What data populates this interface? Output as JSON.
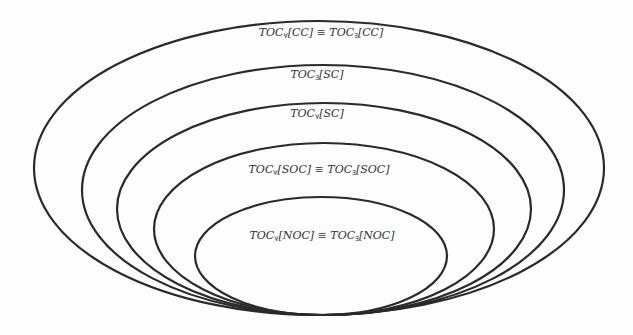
{
  "diagram": {
    "type": "nested-ellipses",
    "stroke_color": "#2a2a2a",
    "sets": [
      {
        "id": "CC",
        "label_parts": {
          "a": "TOC",
          "s1": "∀",
          "b": "[CC] ≡ TOC",
          "s2": "∃",
          "c": "[CC]"
        },
        "ellipse": {
          "cx": 319,
          "cy": 168,
          "rx": 285,
          "ry": 147
        },
        "label_pos": {
          "x": 321,
          "y": 34
        }
      },
      {
        "id": "SC_exists",
        "label_parts": {
          "a": "TOC",
          "s1": "∃",
          "b": "[SC]",
          "s2": "",
          "c": ""
        },
        "ellipse": {
          "cx": 323,
          "cy": 190,
          "rx": 241,
          "ry": 125
        },
        "label_pos": {
          "x": 317,
          "y": 76
        }
      },
      {
        "id": "SC_forall",
        "label_parts": {
          "a": "TOC",
          "s1": "∀",
          "b": "[SC]",
          "s2": "",
          "c": ""
        },
        "ellipse": {
          "cx": 324,
          "cy": 209,
          "rx": 207,
          "ry": 106
        },
        "label_pos": {
          "x": 317,
          "y": 115
        }
      },
      {
        "id": "SOC",
        "label_parts": {
          "a": "TOC",
          "s1": "∀",
          "b": "[SOC] ≡ TOC",
          "s2": "∃",
          "c": "[SOC]"
        },
        "ellipse": {
          "cx": 324,
          "cy": 229,
          "rx": 170,
          "ry": 86
        },
        "label_pos": {
          "x": 319,
          "y": 171
        }
      },
      {
        "id": "NOC",
        "label_parts": {
          "a": "TOC",
          "s1": "∀",
          "b": "[NOC] ≡ TOC",
          "s2": "∃",
          "c": "[NOC]"
        },
        "ellipse": {
          "cx": 321,
          "cy": 256,
          "rx": 126,
          "ry": 59
        },
        "label_pos": {
          "x": 322,
          "y": 237
        }
      }
    ]
  }
}
